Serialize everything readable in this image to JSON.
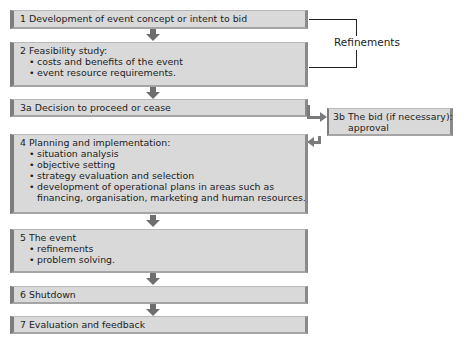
{
  "diagram": {
    "steps": [
      {
        "id": "1",
        "title": "1  Development of event concept or intent to bid",
        "bullets": []
      },
      {
        "id": "2",
        "title": "2  Feasibility study:",
        "bullets": [
          "costs and benefits of the event",
          "event resource requirements."
        ]
      },
      {
        "id": "3a",
        "title": "3a Decision to proceed or cease",
        "bullets": []
      },
      {
        "id": "3b",
        "title": "3b The bid (if necessary):",
        "subtitle": "approval"
      },
      {
        "id": "4",
        "title": "4  Planning and implementation:",
        "bullets": [
          "situation analysis",
          "objective setting",
          "strategy evaluation and selection",
          "development of operational plans in areas such as"
        ],
        "continuation": "financing, organisation, marketing and human resources."
      },
      {
        "id": "5",
        "title": "5  The event",
        "bullets": [
          "refinements",
          "problem solving."
        ]
      },
      {
        "id": "6",
        "title": "6  Shutdown",
        "bullets": []
      },
      {
        "id": "7",
        "title": "7  Evaluation and feedback",
        "bullets": []
      }
    ],
    "refinements_label": "Refinements",
    "colors": {
      "box_fill": "#d9d9d9",
      "box_edge": "#7d7d7d",
      "arrow": "#6e6e6e",
      "line": "#222222"
    }
  }
}
